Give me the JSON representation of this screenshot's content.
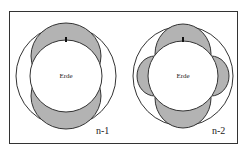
{
  "figure": {
    "panels": [
      {
        "id": "n-1",
        "label": "n-1",
        "center_label": "Erde",
        "lobes": "two (top and bottom)"
      },
      {
        "id": "n-2",
        "label": "n-2",
        "center_label": "Erde",
        "lobes": "four (top, bottom, left, right)"
      }
    ],
    "colors": {
      "lobe_fill": "#b3b3b3",
      "stroke": "#333333",
      "background": "#ffffff"
    }
  }
}
